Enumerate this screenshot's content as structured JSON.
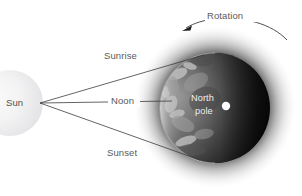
{
  "diagram": {
    "background_color": "#ffffff",
    "sun": {
      "label": "Sun",
      "label_color": "#4e4e4e",
      "body_color": "#ececed",
      "center_x": 10,
      "center_y": 103,
      "radius": 33
    },
    "earth": {
      "label_line1": "North",
      "label_line2": "pole",
      "label_color": "#f2f2f2",
      "dark_side_color": "#0a0a0a",
      "glow_color": "#1a1a1a",
      "pole_marker_color": "#ffffff",
      "center_x": 215,
      "center_y": 108,
      "radius": 55
    },
    "rotation": {
      "label": "Rotation",
      "label_color": "#5a5a5a",
      "arrow_direction": "counterclockwise-left",
      "arc_color": "#3c3c3c"
    },
    "rays": [
      {
        "name": "sunrise",
        "label": "Sunrise",
        "label_x": 104,
        "label_y": 59
      },
      {
        "name": "noon",
        "label": "Noon",
        "label_x": 111,
        "label_y": 104
      },
      {
        "name": "sunset",
        "label": "Sunset",
        "label_x": 107,
        "label_y": 156
      }
    ],
    "ray_origin": {
      "x": 40,
      "y": 103
    },
    "line_color": "#3c3c3c"
  }
}
